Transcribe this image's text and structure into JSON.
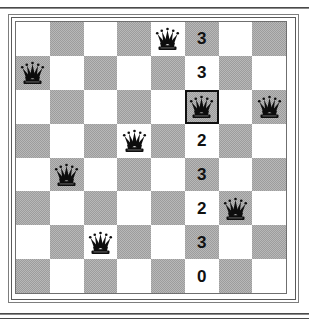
{
  "figure": {
    "type": "chessboard-puzzle",
    "board_size": 8,
    "piece_icon": "black-queen-icon",
    "highlight_color": "#101010",
    "light_square_color": "#ffffff",
    "dark_square_color": "#9c9c9c"
  },
  "chart_data": {
    "type": "table",
    "title": "",
    "xlabel": "",
    "ylabel": "",
    "rows": 8,
    "cols": 8,
    "categories": [
      "row 1",
      "row 2",
      "row 3",
      "row 4",
      "row 5",
      "row 6",
      "row 7",
      "row 8"
    ],
    "values": [
      3,
      3,
      null,
      2,
      3,
      2,
      3,
      0
    ],
    "queen_positions": [
      {
        "row": 0,
        "col": 4
      },
      {
        "row": 1,
        "col": 0
      },
      {
        "row": 2,
        "col": 5
      },
      {
        "row": 2,
        "col": 7
      },
      {
        "row": 3,
        "col": 3
      },
      {
        "row": 4,
        "col": 1
      },
      {
        "row": 5,
        "col": 6
      },
      {
        "row": 6,
        "col": 2
      }
    ],
    "highlighted_cell": {
      "row": 2,
      "col": 5
    },
    "number_column": 5
  },
  "cells": [
    [
      {
        "shade": "light"
      },
      {
        "shade": "dark"
      },
      {
        "shade": "light"
      },
      {
        "shade": "dark"
      },
      {
        "shade": "light",
        "piece": "queen"
      },
      {
        "shade": "dark",
        "label": "3"
      },
      {
        "shade": "light"
      },
      {
        "shade": "dark"
      }
    ],
    [
      {
        "shade": "dark",
        "piece": "queen"
      },
      {
        "shade": "light"
      },
      {
        "shade": "dark"
      },
      {
        "shade": "light"
      },
      {
        "shade": "dark"
      },
      {
        "shade": "light",
        "label": "3"
      },
      {
        "shade": "dark"
      },
      {
        "shade": "light"
      }
    ],
    [
      {
        "shade": "light"
      },
      {
        "shade": "dark"
      },
      {
        "shade": "light"
      },
      {
        "shade": "dark"
      },
      {
        "shade": "light"
      },
      {
        "shade": "dark",
        "piece": "queen",
        "highlight": true
      },
      {
        "shade": "light"
      },
      {
        "shade": "dark",
        "piece": "queen"
      }
    ],
    [
      {
        "shade": "dark"
      },
      {
        "shade": "light"
      },
      {
        "shade": "dark"
      },
      {
        "shade": "light",
        "piece": "queen"
      },
      {
        "shade": "dark"
      },
      {
        "shade": "light",
        "label": "2"
      },
      {
        "shade": "dark"
      },
      {
        "shade": "light"
      }
    ],
    [
      {
        "shade": "light"
      },
      {
        "shade": "dark",
        "piece": "queen"
      },
      {
        "shade": "light"
      },
      {
        "shade": "dark"
      },
      {
        "shade": "light"
      },
      {
        "shade": "dark",
        "label": "3"
      },
      {
        "shade": "light"
      },
      {
        "shade": "dark"
      }
    ],
    [
      {
        "shade": "dark"
      },
      {
        "shade": "light"
      },
      {
        "shade": "dark"
      },
      {
        "shade": "light"
      },
      {
        "shade": "dark"
      },
      {
        "shade": "light",
        "label": "2"
      },
      {
        "shade": "dark",
        "piece": "queen"
      },
      {
        "shade": "light"
      }
    ],
    [
      {
        "shade": "light"
      },
      {
        "shade": "dark"
      },
      {
        "shade": "light",
        "piece": "queen"
      },
      {
        "shade": "dark"
      },
      {
        "shade": "light"
      },
      {
        "shade": "dark",
        "label": "3"
      },
      {
        "shade": "light"
      },
      {
        "shade": "dark"
      }
    ],
    [
      {
        "shade": "dark"
      },
      {
        "shade": "light"
      },
      {
        "shade": "dark"
      },
      {
        "shade": "light"
      },
      {
        "shade": "dark"
      },
      {
        "shade": "light",
        "label": "0"
      },
      {
        "shade": "dark"
      },
      {
        "shade": "light"
      }
    ]
  ]
}
